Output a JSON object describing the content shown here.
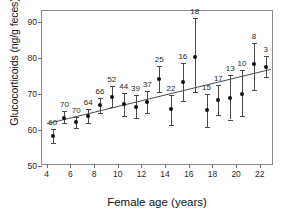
{
  "chart_data": {
    "type": "scatter",
    "title": "",
    "xlabel": "Female age (years)",
    "ylabel": "Glucocorticoids (ng/g feces)",
    "xlim": [
      3.6,
      23.2
    ],
    "ylim": [
      50,
      93
    ],
    "xticks": [
      4,
      6,
      8,
      10,
      12,
      14,
      16,
      18,
      20,
      22
    ],
    "yticks": [
      50,
      60,
      70,
      80,
      90
    ],
    "grid": false,
    "legend": null,
    "marker_color": "#0d0d0d",
    "error_color": "#4a4a4a",
    "line_color": "#4a4a4a",
    "error_type": "95% CI",
    "point_label_meaning": "sample size (n)",
    "x": [
      4.5,
      5.5,
      6.5,
      7.5,
      8.5,
      9.5,
      10.5,
      11.5,
      12.5,
      13.5,
      14.5,
      15.5,
      16.5,
      17.5,
      18.5,
      19.5,
      20.5,
      21.5,
      22.5
    ],
    "values": [
      58.4,
      63.4,
      62.1,
      63.9,
      66.8,
      69.2,
      67.1,
      66.4,
      67.8,
      74.1,
      65.8,
      73.2,
      80.2,
      65.4,
      68.3,
      68.9,
      70.1,
      78.3,
      77.6
    ],
    "err_low": [
      56.4,
      61.9,
      60.6,
      62.0,
      64.7,
      66.4,
      64.0,
      63.3,
      64.8,
      70.4,
      61.5,
      68.1,
      70.4,
      60.7,
      64.2,
      62.9,
      63.8,
      71.2,
      74.6
    ],
    "err_high": [
      60.4,
      65.2,
      63.6,
      65.9,
      69.0,
      72.3,
      70.3,
      69.6,
      70.9,
      77.8,
      69.6,
      78.5,
      91.0,
      70.1,
      72.5,
      75.2,
      76.5,
      84.2,
      80.4
    ],
    "point_labels": [
      "60",
      "70",
      "70",
      "64",
      "66",
      "52",
      "44",
      "39",
      "37",
      "25",
      "22",
      "16",
      "18",
      "15",
      "17",
      "13",
      "10",
      "8",
      "3"
    ],
    "trendline": {
      "x0": 4.0,
      "y0": 61.3,
      "x1": 23.1,
      "y1": 76.6
    }
  }
}
